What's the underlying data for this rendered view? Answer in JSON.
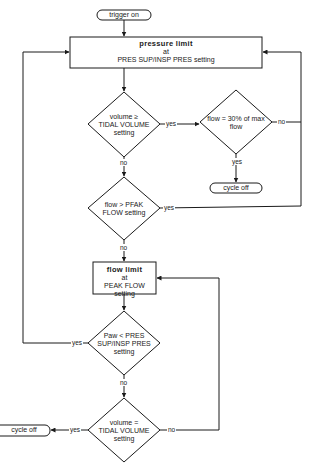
{
  "diagram": {
    "type": "flowchart",
    "title": "",
    "nodes": {
      "start": {
        "type": "terminal",
        "label": "trigger on"
      },
      "pressure_limit": {
        "type": "process",
        "line1": "pressure  limit",
        "line2": "at",
        "line3": "PRES SUP/INSP PRES setting"
      },
      "decision_volume_ge": {
        "type": "decision",
        "line1": "volume ≥",
        "line2": "TIDAL VOLUME",
        "line3": "setting"
      },
      "decision_flow_30": {
        "type": "decision",
        "line1": "flow = 30% of max",
        "line2": "flow"
      },
      "cycle_off_right": {
        "type": "terminal",
        "label": "cycle off"
      },
      "decision_flow_peak": {
        "type": "decision",
        "line1": "flow > PFAK",
        "line2": "FLOW setting"
      },
      "flow_limit": {
        "type": "process",
        "line1": "flow  limit",
        "line2": "at",
        "line3": "PEAK FLOW setting"
      },
      "decision_paw": {
        "type": "decision",
        "line1": "Paw < PRES",
        "line2": "SUP/INSP PRES",
        "line3": "setting"
      },
      "decision_volume_eq": {
        "type": "decision",
        "line1": "volume =",
        "line2": "TIDAL VOLUME",
        "line3": "setting"
      },
      "cycle_off_left": {
        "type": "terminal",
        "label": "cycle off"
      }
    },
    "edge_labels": {
      "vol_ge_yes": "yes",
      "vol_ge_no": "no",
      "flow30_yes": "yes",
      "flow30_no": "no",
      "flowpeak_yes": "yes",
      "flowpeak_no": "no",
      "paw_yes": "yes",
      "paw_no": "no",
      "vol_eq_yes": "yes",
      "vol_eq_no": "no"
    },
    "edges": [
      {
        "from": "start",
        "to": "pressure_limit"
      },
      {
        "from": "pressure_limit",
        "to": "decision_volume_ge"
      },
      {
        "from": "decision_volume_ge",
        "to": "decision_flow_30",
        "label": "yes"
      },
      {
        "from": "decision_volume_ge",
        "to": "decision_flow_peak",
        "label": "no"
      },
      {
        "from": "decision_flow_30",
        "to": "cycle_off_right",
        "label": "yes"
      },
      {
        "from": "decision_flow_30",
        "to": "pressure_limit",
        "label": "no"
      },
      {
        "from": "decision_flow_peak",
        "to": "pressure_limit",
        "label": "yes"
      },
      {
        "from": "decision_flow_peak",
        "to": "flow_limit",
        "label": "no"
      },
      {
        "from": "flow_limit",
        "to": "decision_paw"
      },
      {
        "from": "decision_paw",
        "to": "pressure_limit",
        "label": "yes"
      },
      {
        "from": "decision_paw",
        "to": "decision_volume_eq",
        "label": "no"
      },
      {
        "from": "decision_volume_eq",
        "to": "cycle_off_left",
        "label": "yes"
      },
      {
        "from": "decision_volume_eq",
        "to": "flow_limit",
        "label": "no"
      }
    ],
    "colors": {
      "stroke": "#1a1a1a",
      "background": "#ffffff"
    }
  }
}
